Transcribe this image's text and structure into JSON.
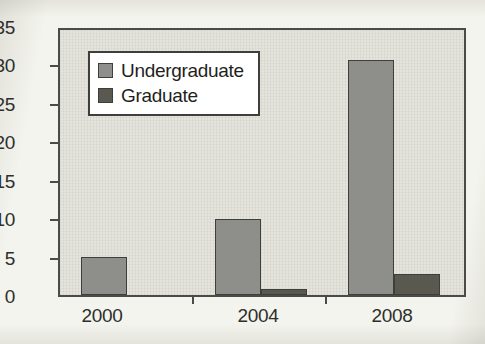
{
  "chart_data": {
    "type": "bar",
    "title": "",
    "subtitle": "",
    "xlabel": "",
    "ylabel": "",
    "categories": [
      "2000",
      "2004",
      "2008"
    ],
    "series": [
      {
        "name": "Undergraduate",
        "color": "#8e8e8b",
        "values": [
          5,
          10,
          31
        ]
      },
      {
        "name": "Graduate",
        "color": "#59594f",
        "values": [
          0,
          0.8,
          2.8
        ]
      }
    ],
    "ylim": [
      0,
      35
    ],
    "yticks": [
      0,
      5,
      10,
      15,
      20,
      25,
      30,
      35
    ],
    "ytick_labels": [
      "0",
      "5",
      "10",
      "15",
      "20",
      "25",
      "30",
      "35"
    ],
    "xtick_labels": [
      "2000",
      "2004",
      "2008"
    ],
    "grid": false,
    "legend_position": "upper left",
    "plot_background": "#e4e4dd",
    "axis_color": "#4b4b47"
  },
  "legend": {
    "entries": [
      {
        "label": "Undergraduate",
        "swatch": "legend-swatch-undergraduate"
      },
      {
        "label": "Graduate",
        "swatch": "legend-swatch-graduate"
      }
    ]
  }
}
